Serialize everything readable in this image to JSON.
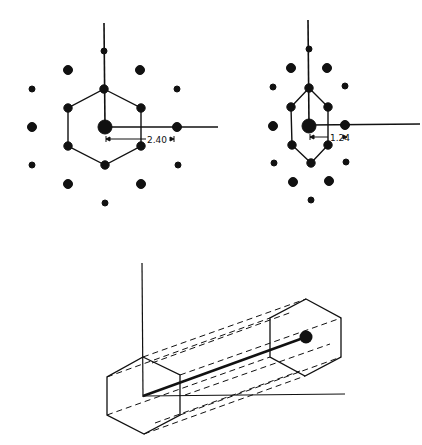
{
  "figure": {
    "colors": {
      "ink": "#111111",
      "background": "#ffffff"
    },
    "left_lattice": {
      "dimension_label": "2.40",
      "center": [
        105,
        127
      ]
    },
    "right_lattice": {
      "dimension_label": "1.24",
      "center": [
        309,
        126
      ]
    },
    "bottom_projection": {
      "description": "Hexagonal prism projection with dashed connectors between two hexagons"
    }
  }
}
